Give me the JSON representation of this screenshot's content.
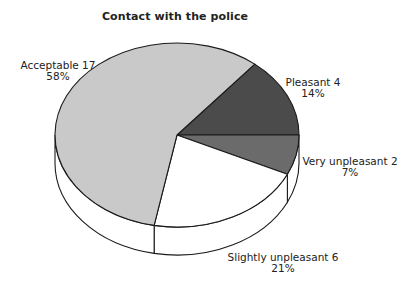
{
  "chart_data": {
    "type": "pie",
    "style": "3d",
    "title": "Contact with the police",
    "slices": [
      {
        "label": "Pleasant",
        "count": 4,
        "percent": 14,
        "color": "#4b4b4b"
      },
      {
        "label": "Very unpleasant",
        "count": 2,
        "percent": 7,
        "color": "#6b6b6b"
      },
      {
        "label": "Slightly unpleasant",
        "count": 6,
        "percent": 21,
        "color": "#ffffff"
      },
      {
        "label": "Acceptable",
        "count": 17,
        "percent": 58,
        "color": "#c9c9c9"
      }
    ],
    "legend": "none (labels beside slices)"
  },
  "labels": {
    "acceptable": {
      "name": "Acceptable 17",
      "pct": "58%"
    },
    "pleasant": {
      "name": "Pleasant 4",
      "pct": "14%"
    },
    "very_unpleasant": {
      "name": "Very unpleasant 2",
      "pct": "7%"
    },
    "slightly_unpleasant": {
      "name": "Slightly unpleasant 6",
      "pct": "21%"
    }
  }
}
